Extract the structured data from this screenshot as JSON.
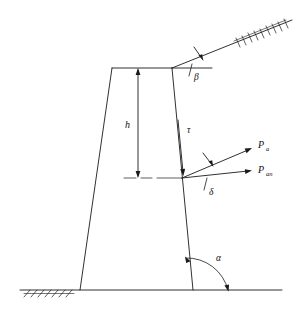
{
  "figure": {
    "type": "engineering-diagram",
    "background_color": "#ffffff",
    "line_color": "#1a1a1a"
  },
  "labels": {
    "height": "h",
    "shear_stress": "τ",
    "force_resultant": "P",
    "force_resultant_sub": "a",
    "force_normal": "P",
    "force_normal_sub": "an",
    "angle_backfill": "β",
    "angle_wall_friction": "δ",
    "angle_wall_base": "α"
  },
  "geometry": {
    "wall": {
      "top_left": [
        112,
        68
      ],
      "top_right": [
        172,
        68
      ],
      "bottom_right": [
        193,
        290
      ],
      "bottom_left": [
        80,
        290
      ]
    },
    "ground_line": {
      "x1": 20,
      "y1": 290,
      "x2": 282,
      "y2": 290
    },
    "backfill_slope": {
      "x1": 172,
      "y1": 68,
      "x2": 292,
      "y2": 20
    },
    "force_origin": [
      182,
      178
    ],
    "pa_tip": [
      252,
      148
    ],
    "pan_tip": [
      252,
      172
    ],
    "height_dimension": {
      "x": 138,
      "y_top": 68,
      "y_bottom": 178
    }
  },
  "hatching": {
    "ground_left_count": 7,
    "slope_count": 9
  }
}
